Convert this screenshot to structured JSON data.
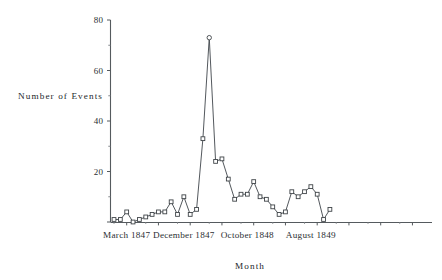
{
  "chart_data": {
    "type": "line",
    "title": "",
    "xlabel": "Month",
    "ylabel": "Number of Events",
    "ylim": [
      0,
      80
    ],
    "yticks": [
      0,
      20,
      40,
      60,
      80
    ],
    "ytick_labels": [
      "",
      "20",
      "40",
      "60",
      "80"
    ],
    "yticks_minor": [
      10,
      30,
      50,
      70
    ],
    "grid": false,
    "legend": "none",
    "marker": "open-square",
    "peak_marker": "open-circle",
    "x": [
      1,
      2,
      3,
      4,
      5,
      6,
      7,
      8,
      9,
      10,
      11,
      12,
      13,
      14,
      15,
      16,
      17,
      18,
      19,
      20,
      21,
      22,
      23,
      24,
      25,
      26,
      27,
      28,
      29,
      30,
      31,
      32,
      33,
      34,
      35,
      36,
      37,
      38,
      39,
      40
    ],
    "xtick_labels": [
      "March 1847",
      "December 1847",
      "October 1848",
      "August 1849"
    ],
    "xtick_positions": [
      2,
      11,
      21,
      31
    ],
    "values": [
      1,
      1,
      4,
      0,
      1,
      2,
      3,
      4,
      4,
      8,
      3,
      10,
      3,
      5,
      33,
      73,
      24,
      25,
      17,
      9,
      11,
      11,
      16,
      10,
      9,
      6,
      3,
      4,
      12,
      10,
      12,
      14,
      11,
      1,
      5
    ],
    "categories": [
      "March 1847",
      "April 1847",
      "May 1847",
      "June 1847",
      "July 1847",
      "August 1847",
      "September 1847",
      "October 1847",
      "November 1847",
      "December 1847",
      "January 1848",
      "February 1848",
      "March 1848",
      "April 1848",
      "May 1848",
      "June 1848",
      "July 1848",
      "August 1848",
      "September 1848",
      "October 1848",
      "November 1848",
      "December 1848",
      "January 1849",
      "February 1849",
      "March 1849",
      "April 1849",
      "May 1849",
      "June 1849",
      "July 1849",
      "August 1849",
      "September 1849",
      "October 1849",
      "November 1849",
      "December 1849",
      "January 1850"
    ],
    "peak_index": 15,
    "peak_value": 73,
    "annotations": []
  },
  "axes": {
    "y_title": "Number  of  Events",
    "x_title": "Month"
  }
}
